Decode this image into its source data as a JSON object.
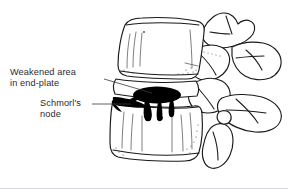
{
  "figure": {
    "background_color": "#ffffff",
    "ink_color": "#1a1a1a",
    "label_color": "#2b2b33",
    "lesion_color": "#000000",
    "view": "lateral lumbar spine",
    "labels": [
      {
        "id": "weakened-area",
        "line1": "Weakened area",
        "line2": "in end-plate",
        "x": 10,
        "y": 75,
        "leader_from_x": 104,
        "leader_from_y": 79,
        "leader_to_x": 152,
        "leader_to_y": 93
      },
      {
        "id": "schmorls-node",
        "line1": "Schmorl's",
        "line2": "node",
        "x": 40,
        "y": 106,
        "leader_from_x": 92,
        "leader_from_y": 104,
        "leader_to_x": 131,
        "leader_to_y": 104
      }
    ],
    "structures": [
      {
        "name": "upper-vertebral-body",
        "kind": "bone"
      },
      {
        "name": "lower-vertebral-body",
        "kind": "bone"
      },
      {
        "name": "intervertebral-disc-space",
        "kind": "disc"
      },
      {
        "name": "superior-articular-process",
        "kind": "bone"
      },
      {
        "name": "inferior-articular-process",
        "kind": "bone"
      },
      {
        "name": "spinous-process-upper",
        "kind": "bone"
      },
      {
        "name": "spinous-process-lower",
        "kind": "bone"
      },
      {
        "name": "transverse-process",
        "kind": "bone"
      },
      {
        "name": "pedicle",
        "kind": "bone"
      },
      {
        "name": "schmorls-node-lesion",
        "kind": "lesion"
      },
      {
        "name": "weakened-endplate-defect",
        "kind": "lesion"
      }
    ]
  }
}
